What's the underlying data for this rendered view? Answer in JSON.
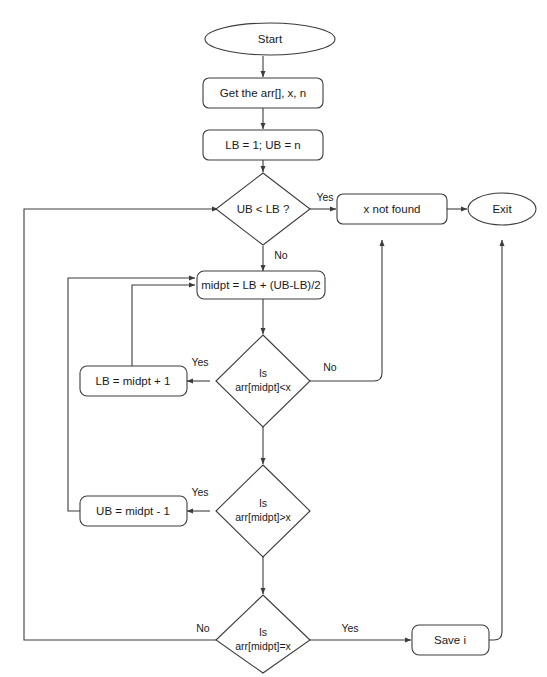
{
  "diagram": {
    "type": "flowchart",
    "colors": {
      "background": "#ffffff",
      "stroke": "#3c3c3c",
      "text": "#1a1a1a",
      "fill": "#ffffff"
    },
    "nodes": {
      "start": {
        "label": "Start",
        "shape": "terminator"
      },
      "input": {
        "label": "Get the arr[], x, n",
        "shape": "process"
      },
      "init": {
        "label": "LB = 1; UB = n",
        "shape": "process"
      },
      "check_bounds": {
        "label": "UB < LB ?",
        "shape": "decision"
      },
      "not_found": {
        "label": "x not found",
        "shape": "process"
      },
      "exit": {
        "label": "Exit",
        "shape": "terminator"
      },
      "midpt": {
        "label": "midpt = LB + (UB-LB)/2",
        "shape": "process"
      },
      "cmp_less": {
        "label_line1": "Is",
        "label_line2": "arr[midpt]<x",
        "shape": "decision"
      },
      "lb_update": {
        "label": "LB = midpt + 1",
        "shape": "process"
      },
      "cmp_greater": {
        "label_line1": "Is",
        "label_line2": "arr[midpt]>x",
        "shape": "decision"
      },
      "ub_update": {
        "label": "UB = midpt - 1",
        "shape": "process"
      },
      "cmp_equal": {
        "label_line1": "Is",
        "label_line2": "arr[midpt]=x",
        "shape": "decision"
      },
      "save": {
        "label": "Save i",
        "shape": "process"
      }
    },
    "edge_labels": {
      "bounds_yes": "Yes",
      "bounds_no": "No",
      "less_yes": "Yes",
      "less_no": "No",
      "greater_yes": "Yes",
      "equal_no": "No",
      "equal_yes": "Yes"
    }
  }
}
